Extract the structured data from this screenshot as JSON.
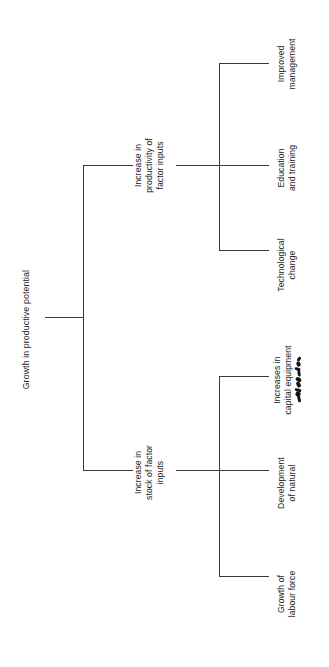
{
  "diagram": {
    "type": "tree",
    "orientation": "horizontal-rotated-90",
    "background_color": "#ffffff",
    "line_color": "#3a3a3a",
    "text_color": "#1c1c1c",
    "root": {
      "id": "growth-in-productive-potential",
      "lines": [
        "Growth in productive potential"
      ]
    },
    "branches": [
      {
        "id": "increase-in-productivity-of-factor-inputs",
        "lines": [
          "Increase in",
          "productivity of",
          "factor inputs"
        ],
        "children": [
          {
            "id": "improved-management",
            "lines": [
              "Improved",
              "management"
            ]
          },
          {
            "id": "education-and-training",
            "lines": [
              "Education",
              "and training"
            ]
          },
          {
            "id": "technological-change",
            "lines": [
              "Technological",
              "change"
            ]
          }
        ]
      },
      {
        "id": "increase-in-stock-of-factor-inputs",
        "lines": [
          "Increase in",
          "stock of factor",
          "inputs"
        ],
        "children": [
          {
            "id": "increases-in-capital-equipment",
            "lines": [
              "Increases in",
              "capital equipment"
            ],
            "annotation": "illegible-handwritten-scribble"
          },
          {
            "id": "development-of-natural",
            "lines": [
              "Development",
              "of natural"
            ]
          },
          {
            "id": "growth-of-labour-force",
            "lines": [
              "Growth of",
              "labour force"
            ]
          }
        ]
      }
    ]
  }
}
